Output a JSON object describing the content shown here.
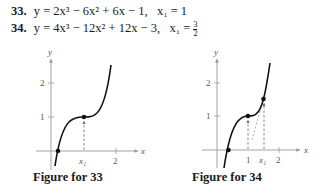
{
  "problems": [
    {
      "number": "33.",
      "equation": "y = 2x³ − 6x² + 6x − 1,",
      "x1_label": "x₁ = 1"
    },
    {
      "number": "34.",
      "equation": "y = 4x³ − 12x² + 12x − 3,",
      "x1_label": "x₁ =",
      "x1_num": "3",
      "x1_den": "2"
    }
  ],
  "figures": [
    {
      "caption": "Figure for 33",
      "axis_x_label": "x",
      "axis_y_label": "y",
      "x_ticks": [
        "x₁",
        "2"
      ],
      "y_ticks": [
        "1",
        "2"
      ]
    },
    {
      "caption": "Figure for 34",
      "axis_x_label": "x",
      "axis_y_label": "y",
      "x_ticks": [
        "1",
        "x₁",
        "2"
      ],
      "y_ticks": [
        "1",
        "2"
      ]
    }
  ]
}
